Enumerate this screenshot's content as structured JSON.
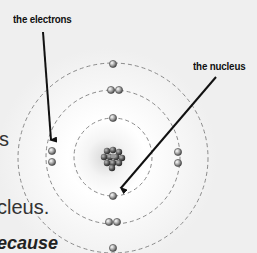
{
  "diagram": {
    "labels": {
      "electrons": "the electrons",
      "nucleus": "the nucleus"
    },
    "side_text": {
      "line1": "s",
      "line2": "cleus.",
      "line3": "ecause"
    },
    "orbits": [
      {
        "name": "inner-shell",
        "electrons": 2
      },
      {
        "name": "middle-shell",
        "electrons": 8
      },
      {
        "name": "outer-shell",
        "electrons": 2
      }
    ],
    "colors": {
      "background": "#efefef",
      "glow": "#ffffff",
      "orbit": "#8a8a8a",
      "arrow": "#111111",
      "electron": "#9a9a9a",
      "nucleus": "#4a4a4a"
    }
  }
}
